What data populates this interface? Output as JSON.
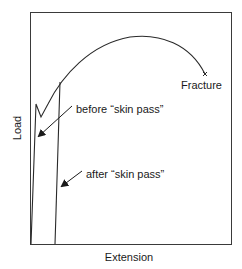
{
  "diagram": {
    "axes": {
      "xlabel": "Extension",
      "ylabel": "Load"
    },
    "annotations": {
      "fracture": "Fracture",
      "before": "before “skin pass”",
      "after": "after “skin pass”"
    },
    "colors": {
      "line": "#2a2a2a",
      "frame": "#3a3a3a",
      "text": "#1a1a1a",
      "background": "#ffffff"
    }
  }
}
